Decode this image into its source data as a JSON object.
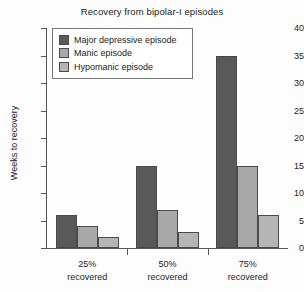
{
  "chart_data": {
    "type": "bar",
    "title": "Recovery from bipolar-I episodes",
    "xlabel": "",
    "ylabel": "Weeks to recovery",
    "categories": [
      "25% recovered",
      "50% recovered",
      "75% recovered"
    ],
    "category_lines": [
      [
        "25%",
        "recovered"
      ],
      [
        "50%",
        "recovered"
      ],
      [
        "75%",
        "recovered"
      ]
    ],
    "series": [
      {
        "name": "Major depressive episode",
        "values": [
          6,
          15,
          35
        ],
        "color": "#595959"
      },
      {
        "name": "Manic episode",
        "values": [
          4,
          7,
          15
        ],
        "color": "#a8a8a8"
      },
      {
        "name": "Hypomanic episode",
        "values": [
          2,
          3,
          6
        ],
        "color": "#b5b5b5"
      }
    ],
    "ylim": [
      0,
      40
    ],
    "yticks": [
      0,
      5,
      10,
      15,
      20,
      25,
      30,
      35,
      40
    ],
    "ytick_labels": [
      "0",
      "5",
      "10",
      "15",
      "20",
      "25",
      "30",
      "35",
      "40"
    ],
    "grid": false,
    "legend_position": "upper left"
  }
}
